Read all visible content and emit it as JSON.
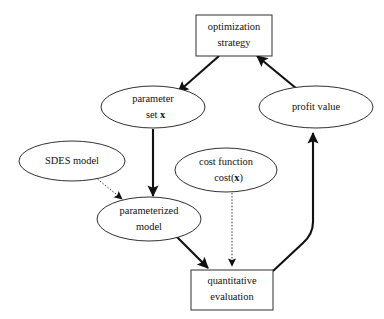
{
  "diagram": {
    "background_color": "#ffffff",
    "stroke_color": "#111111",
    "nodes": [
      {
        "id": "optimization-strategy",
        "shape": "rectangle",
        "line1": "optimization",
        "line2": "strategy"
      },
      {
        "id": "parameter-set",
        "shape": "ellipse",
        "line1": "parameter",
        "line2_prefix": "set ",
        "line2_bold": "x"
      },
      {
        "id": "profit-value",
        "shape": "ellipse",
        "line1": "profit value",
        "line2": ""
      },
      {
        "id": "sdes-model",
        "shape": "ellipse",
        "line1": "SDES model",
        "line2": ""
      },
      {
        "id": "cost-function",
        "shape": "ellipse",
        "line1": "cost function",
        "line2_prefix": "cost(",
        "line2_bold": "x",
        "line2_suffix": ")"
      },
      {
        "id": "parameterized-model",
        "shape": "ellipse",
        "line1": "parameterized",
        "line2": "model"
      },
      {
        "id": "quantitative-evaluation",
        "shape": "rectangle",
        "line1": "quantitative",
        "line2": "evaluation"
      }
    ],
    "edges": [
      {
        "id": "opt-to-parameter",
        "from": "optimization-strategy",
        "to": "parameter-set",
        "style": "solid",
        "arrow": true
      },
      {
        "id": "profit-to-opt",
        "from": "profit-value",
        "to": "optimization-strategy",
        "style": "solid",
        "arrow": true
      },
      {
        "id": "parameter-to-parameterized",
        "from": "parameter-set",
        "to": "parameterized-model",
        "style": "solid",
        "arrow": true
      },
      {
        "id": "sdes-to-parameterized",
        "from": "sdes-model",
        "to": "parameterized-model",
        "style": "dotted",
        "arrow": true
      },
      {
        "id": "parameterized-to-quant",
        "from": "parameterized-model",
        "to": "quantitative-evaluation",
        "style": "solid",
        "arrow": true
      },
      {
        "id": "cost-to-quant",
        "from": "cost-function",
        "to": "quantitative-evaluation",
        "style": "dotted",
        "arrow": true
      },
      {
        "id": "quant-to-profit",
        "from": "quantitative-evaluation",
        "to": "profit-value",
        "style": "solid",
        "arrow": true
      }
    ]
  }
}
